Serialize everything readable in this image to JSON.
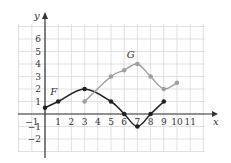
{
  "chart_data": {
    "type": "line",
    "title": "",
    "xlabel": "x",
    "ylabel": "y",
    "xlim": [
      -2,
      12
    ],
    "ylim": [
      -3,
      7
    ],
    "grid": true,
    "x_ticks": [
      -1,
      1,
      2,
      3,
      4,
      5,
      6,
      7,
      8,
      9,
      10,
      11
    ],
    "y_ticks": [
      -2,
      -1,
      1,
      2,
      3,
      4,
      5,
      6
    ],
    "series": [
      {
        "name": "F",
        "color": "#222222",
        "points": [
          [
            0,
            0.5
          ],
          [
            1,
            1
          ],
          [
            3,
            2
          ],
          [
            5,
            1
          ],
          [
            6,
            0
          ],
          [
            7,
            -1
          ],
          [
            8,
            0
          ],
          [
            9,
            1
          ]
        ],
        "label_pos": [
          0.4,
          1.5
        ]
      },
      {
        "name": "G",
        "color": "#a0a0a0",
        "points": [
          [
            3,
            1
          ],
          [
            5,
            3
          ],
          [
            6,
            3.5
          ],
          [
            7,
            4
          ],
          [
            8,
            3
          ],
          [
            9,
            2
          ],
          [
            10,
            2.5
          ]
        ],
        "label_pos": [
          6.2,
          4.5
        ]
      }
    ]
  },
  "colors": {
    "grid": "#d9d9d9",
    "axis": "#333333"
  }
}
